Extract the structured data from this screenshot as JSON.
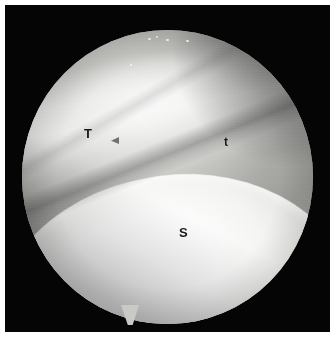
{
  "figure": {
    "kind": "arthroscopic-photograph",
    "modality": "arthroscopy",
    "width": 335,
    "height": 337,
    "page_background": "#ffffff",
    "field_background": "#050505",
    "caption": ""
  },
  "scope": {
    "shape": "circle",
    "center_x": 167,
    "center_y": 175,
    "radius": 145,
    "has_bottom_tail_notch": true,
    "tail_x": 130,
    "tail_y": 316,
    "vignette": true
  },
  "anatomy": {
    "regions": [
      {
        "name": "upper-grey-tissue",
        "description": "grey soft tissue occupying the upper half of the scope view",
        "tone": "#cfcfcc"
      },
      {
        "name": "bright-highlight-band",
        "description": "broad specular band across the upper-middle of the field",
        "tone": "#f2f2f0"
      },
      {
        "name": "diagonal-fold",
        "description": "linear groove running from upper-right toward lower-left",
        "tone": "#8e8e8b"
      },
      {
        "name": "lower-left-shadow",
        "description": "darker grey band in the lower-left quadrant",
        "tone": "#6e6e6b"
      },
      {
        "name": "bright-convex-structure",
        "description": "brilliant white convex surface filling the lower portion of the field",
        "tone": "#ffffff"
      }
    ]
  },
  "annotations": {
    "labels": [
      {
        "id": "label-T",
        "text": "T",
        "x": 88,
        "y": 139,
        "case": "upper",
        "color": "#1a1a1a"
      },
      {
        "id": "label-t",
        "text": "t",
        "x": 228,
        "y": 148,
        "case": "lower",
        "color": "#1a1a1a"
      },
      {
        "id": "label-S",
        "text": "S",
        "x": 183,
        "y": 238,
        "case": "upper",
        "color": "#1a1a1a"
      }
    ],
    "markers": [
      {
        "id": "marker-arrow",
        "icon": "arrowhead-marker",
        "x": 115,
        "y": 145,
        "color": "#4a4a4a"
      }
    ]
  },
  "specks": [
    {
      "x": 148,
      "y": 36,
      "w": 3,
      "h": 2
    },
    {
      "x": 156,
      "y": 34,
      "w": 2,
      "h": 2
    },
    {
      "x": 166,
      "y": 37,
      "w": 3,
      "h": 2
    },
    {
      "x": 186,
      "y": 38,
      "w": 3,
      "h": 2
    },
    {
      "x": 130,
      "y": 62,
      "w": 2,
      "h": 2
    }
  ]
}
